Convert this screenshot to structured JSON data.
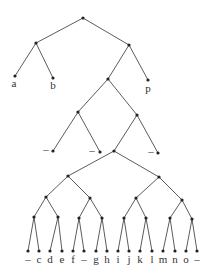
{
  "diagram": {
    "type": "binary-tree",
    "nodes": [
      {
        "id": "root",
        "x": 83,
        "y": 18
      },
      {
        "id": "n1",
        "x": 36,
        "y": 43
      },
      {
        "id": "a",
        "x": 15,
        "y": 76,
        "label": "a",
        "lx": 14,
        "ly": 87
      },
      {
        "id": "b",
        "x": 53,
        "y": 78,
        "label": "b",
        "lx": 53,
        "ly": 89
      },
      {
        "id": "n2",
        "x": 129,
        "y": 45
      },
      {
        "id": "p",
        "x": 148,
        "y": 80,
        "label": "p",
        "lx": 148,
        "ly": 92
      },
      {
        "id": "n3",
        "x": 108,
        "y": 79
      },
      {
        "id": "n4",
        "x": 78,
        "y": 112
      },
      {
        "id": "d1",
        "x": 53,
        "y": 151,
        "label": "–",
        "lx": 46,
        "ly": 153
      },
      {
        "id": "d2",
        "x": 100,
        "y": 152,
        "label": "–",
        "lx": 92,
        "ly": 154
      },
      {
        "id": "n5",
        "x": 137,
        "y": 115
      },
      {
        "id": "d3",
        "x": 158,
        "y": 153,
        "label": "–",
        "lx": 151,
        "ly": 155
      },
      {
        "id": "n6",
        "x": 114,
        "y": 151
      },
      {
        "id": "L1a",
        "x": 68,
        "y": 176
      },
      {
        "id": "L1b",
        "x": 159,
        "y": 177
      },
      {
        "id": "L2a",
        "x": 46,
        "y": 197
      },
      {
        "id": "L2b",
        "x": 90,
        "y": 198
      },
      {
        "id": "L2c",
        "x": 136,
        "y": 198
      },
      {
        "id": "L2d",
        "x": 182,
        "y": 200
      },
      {
        "id": "L3a",
        "x": 34,
        "y": 217
      },
      {
        "id": "L3b",
        "x": 58,
        "y": 217
      },
      {
        "id": "L3c",
        "x": 79,
        "y": 218
      },
      {
        "id": "L3d",
        "x": 102,
        "y": 218
      },
      {
        "id": "L3e",
        "x": 124,
        "y": 218
      },
      {
        "id": "L3f",
        "x": 146,
        "y": 218
      },
      {
        "id": "L3g",
        "x": 170,
        "y": 218
      },
      {
        "id": "L3h",
        "x": 192,
        "y": 219
      }
    ],
    "edges": [
      [
        "root",
        "n1"
      ],
      [
        "root",
        "n2"
      ],
      [
        "n1",
        "a"
      ],
      [
        "n1",
        "b"
      ],
      [
        "n2",
        "n3"
      ],
      [
        "n2",
        "p"
      ],
      [
        "n3",
        "n4"
      ],
      [
        "n3",
        "n5"
      ],
      [
        "n4",
        "d1"
      ],
      [
        "n4",
        "d2"
      ],
      [
        "n5",
        "n6"
      ],
      [
        "n5",
        "d3"
      ],
      [
        "n6",
        "L1a"
      ],
      [
        "n6",
        "L1b"
      ],
      [
        "L1a",
        "L2a"
      ],
      [
        "L1a",
        "L2b"
      ],
      [
        "L1b",
        "L2c"
      ],
      [
        "L1b",
        "L2d"
      ],
      [
        "L2a",
        "L3a"
      ],
      [
        "L2a",
        "L3b"
      ],
      [
        "L2b",
        "L3c"
      ],
      [
        "L2b",
        "L3d"
      ],
      [
        "L2c",
        "L3e"
      ],
      [
        "L2c",
        "L3f"
      ],
      [
        "L2d",
        "L3g"
      ],
      [
        "L2d",
        "L3h"
      ]
    ],
    "leaves_bottom": {
      "y": 251,
      "label_y": 263,
      "items": [
        {
          "x": 28,
          "label": "–",
          "parent": "L3a"
        },
        {
          "x": 39,
          "label": "c",
          "parent": "L3a"
        },
        {
          "x": 50,
          "label": "d",
          "parent": "L3b"
        },
        {
          "x": 62,
          "label": "e",
          "parent": "L3b"
        },
        {
          "x": 73,
          "label": "f",
          "parent": "L3c"
        },
        {
          "x": 84,
          "label": "–",
          "parent": "L3c"
        },
        {
          "x": 96,
          "label": "g",
          "parent": "L3d"
        },
        {
          "x": 107,
          "label": "h",
          "parent": "L3d"
        },
        {
          "x": 118,
          "label": "i",
          "parent": "L3e"
        },
        {
          "x": 129,
          "label": "j",
          "parent": "L3e"
        },
        {
          "x": 140,
          "label": "k",
          "parent": "L3f"
        },
        {
          "x": 152,
          "label": "l",
          "parent": "L3f"
        },
        {
          "x": 163,
          "label": "m",
          "parent": "L3g"
        },
        {
          "x": 175,
          "label": "n",
          "parent": "L3g"
        },
        {
          "x": 186,
          "label": "o",
          "parent": "L3h"
        },
        {
          "x": 197,
          "label": "–",
          "parent": "L3h"
        }
      ]
    }
  }
}
